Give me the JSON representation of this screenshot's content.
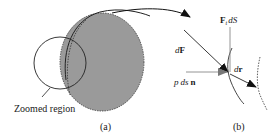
{
  "panel_a": {
    "caption": "(a)",
    "zoomed_region_label": "Zoomed region"
  },
  "panel_b": {
    "caption": "(b)",
    "label_dF_d": "d",
    "label_dF_F": "F",
    "label_pdsn_p": "p",
    "label_pdsn_ds": "ds",
    "label_pdsn_n": "n",
    "label_FtdS_F": "F",
    "label_FtdS_t": "t",
    "label_FtdS_dS": "dS",
    "label_dr_d": "d",
    "label_dr_r": "r"
  },
  "colors": {
    "body_fill": "#9a9a9a",
    "line": "#1a1a1a",
    "light_line": "#888888"
  }
}
